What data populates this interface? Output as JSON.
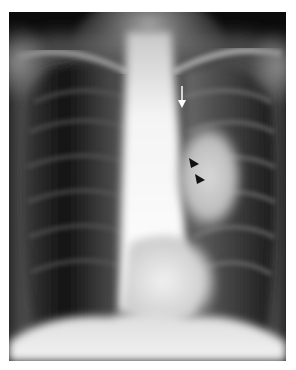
{
  "image": {
    "subject": "Chest X-ray (PA view)",
    "annotations": [
      {
        "type": "arrow",
        "color": "#ffffff",
        "direction": "down",
        "label": "white-arrow"
      },
      {
        "type": "arrowhead",
        "color": "#111111",
        "direction": "right",
        "label": "black-arrowhead-1"
      },
      {
        "type": "arrowhead",
        "color": "#111111",
        "direction": "right",
        "label": "black-arrowhead-2"
      }
    ]
  }
}
